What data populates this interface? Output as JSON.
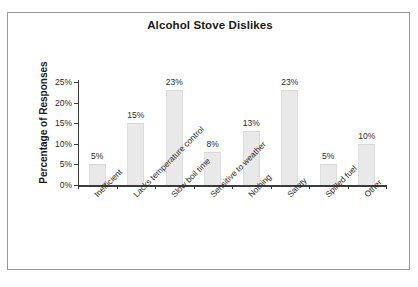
{
  "chart_data": {
    "type": "bar",
    "title": "Alcohol Stove Dislikes",
    "xlabel": "",
    "ylabel": "Percentage of Responses",
    "categories": [
      "Inefficient",
      "Lacks temperature control",
      "Slow boil time",
      "Sensitive to weather",
      "Nothing",
      "Safety",
      "Spilled fuel",
      "Other"
    ],
    "values": [
      5,
      15,
      23,
      8,
      13,
      23,
      5,
      10
    ],
    "value_labels": [
      "5%",
      "15%",
      "23%",
      "8%",
      "13%",
      "23%",
      "5%",
      "10%"
    ],
    "ylim": [
      0,
      25
    ],
    "ytick_values": [
      0,
      5,
      10,
      15,
      20,
      25
    ],
    "ytick_labels": [
      "0%",
      "5%",
      "10%",
      "15%",
      "20%",
      "25%"
    ],
    "grid": false,
    "legend": false,
    "bar_color": "#e9e9e9",
    "axis_color": "#3b3b3b",
    "text_color": "#2a2a2a",
    "frame_color": "#9a9a9a",
    "background_color": "#ffffff",
    "xtick_label_rotation": -45
  }
}
